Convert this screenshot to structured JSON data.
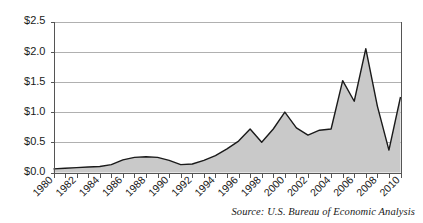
{
  "chart_data": {
    "type": "area",
    "title": "",
    "subtitle": "",
    "xlabel": "",
    "ylabel": "",
    "x": [
      1980,
      1981,
      1982,
      1983,
      1984,
      1985,
      1986,
      1987,
      1988,
      1989,
      1990,
      1991,
      1992,
      1993,
      1994,
      1995,
      1996,
      1997,
      1998,
      1999,
      2000,
      2001,
      2002,
      2003,
      2004,
      2005,
      2006,
      2007,
      2008,
      2009,
      2010
    ],
    "values": [
      0.06,
      0.07,
      0.08,
      0.09,
      0.1,
      0.13,
      0.21,
      0.25,
      0.26,
      0.25,
      0.2,
      0.13,
      0.14,
      0.2,
      0.28,
      0.39,
      0.52,
      0.72,
      0.5,
      0.72,
      1.0,
      0.74,
      0.62,
      0.7,
      0.72,
      1.52,
      1.18,
      2.05,
      1.1,
      0.37,
      1.25
    ],
    "series": [
      {
        "name": "value",
        "values": [
          0.06,
          0.07,
          0.08,
          0.09,
          0.1,
          0.13,
          0.21,
          0.25,
          0.26,
          0.25,
          0.2,
          0.13,
          0.14,
          0.2,
          0.28,
          0.39,
          0.52,
          0.72,
          0.5,
          0.72,
          1.0,
          0.74,
          0.62,
          0.7,
          0.72,
          1.52,
          1.18,
          2.05,
          1.1,
          0.37,
          1.25
        ]
      }
    ],
    "ylim": [
      0.0,
      2.5
    ],
    "ytick_values": [
      0.0,
      0.5,
      1.0,
      1.5,
      2.0,
      2.5
    ],
    "ytick_labels": [
      "$0.0",
      "$0.5",
      "$1.0",
      "$1.5",
      "$2.0",
      "$2.5"
    ],
    "xlim": [
      1980,
      2010
    ],
    "xtick_values": [
      1980,
      1981,
      1982,
      1983,
      1984,
      1985,
      1986,
      1987,
      1988,
      1989,
      1990,
      1991,
      1992,
      1993,
      1994,
      1995,
      1996,
      1997,
      1998,
      1999,
      2000,
      2001,
      2002,
      2003,
      2004,
      2005,
      2006,
      2007,
      2008,
      2009,
      2010
    ],
    "xtick_labels": [
      "1980",
      "",
      "1982",
      "",
      "1984",
      "",
      "1986",
      "",
      "1988",
      "",
      "1990",
      "",
      "1992",
      "",
      "1994",
      "",
      "1996",
      "",
      "1998",
      "",
      "2000",
      "",
      "2002",
      "",
      "2004",
      "",
      "2006",
      "",
      "2008",
      "",
      "2010"
    ],
    "xtick_label_rotation": 45,
    "grid": true,
    "grid_axis": "y",
    "legend": false,
    "legend_position": "none",
    "colors": {
      "area_fill": "#c9c9c9",
      "line": "#1a1a1a",
      "gridline": "#b0b0b0",
      "axis": "#555555",
      "background": "#ffffff",
      "text": "#1a1a1a"
    }
  },
  "annotations": {
    "source_note": "Source: U.S. Bureau of Economic Analysis"
  }
}
